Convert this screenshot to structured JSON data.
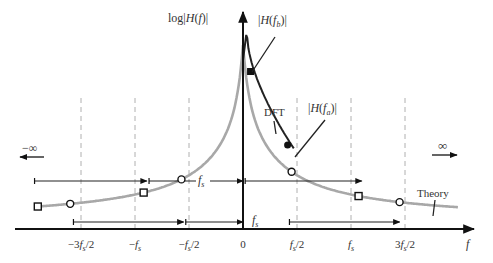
{
  "figure": {
    "y_axis_label": "log|H(f)|",
    "x_axis_label": "f",
    "tick_labels": [
      "-3f_s/2",
      "-f_s",
      "-f_s/2",
      "0",
      "f_s/2",
      "f_s",
      "3f_s/2"
    ],
    "tick_values": [
      -1.5,
      -1,
      -0.5,
      0,
      0.5,
      1,
      1.5
    ],
    "annotations": {
      "H_fb": "|H(f_b)|",
      "H_fa": "|H(f_a)|",
      "dft": "DFT",
      "theory": "Theory",
      "neg_inf": "−∞",
      "pos_inf": "∞",
      "fs_upper": "f_s",
      "fs_lower": "f_s"
    },
    "colors": {
      "theory_curve": "#a8a8a8",
      "dft_curve": "#222222",
      "axis": "#111111",
      "guide": "#b0b0b0",
      "text": "#333333"
    }
  },
  "chart_data": {
    "type": "line",
    "title": "",
    "xlabel": "f",
    "ylabel": "log|H(f)|",
    "x_unit": "f_s",
    "xlim": [
      -2.1,
      2.1
    ],
    "series": [
      {
        "name": "Theory",
        "description": "symmetric decaying log magnitude, peak at f=0"
      },
      {
        "name": "DFT",
        "description": "periodic aliased response, peak near f=0, higher than theory near f_s/2"
      }
    ],
    "markers": {
      "circles_x": [
        -1.6,
        -0.57,
        0.45,
        1.45
      ],
      "squares_x": [
        -1.9,
        -0.92,
        1.07
      ],
      "filled_circle_x": 0.45,
      "filled_square_x": 0.07
    },
    "vertical_guides": [
      -1.5,
      -1,
      -0.5,
      0.5,
      1,
      1.5
    ],
    "span_markers": [
      {
        "label": "f_s",
        "from": -1.9,
        "to": -0.92
      },
      {
        "label": "f_s",
        "from": -0.92,
        "to": 0.07
      },
      {
        "label": "f_s",
        "from": 0.07,
        "to": 1.07
      },
      {
        "label": "f_s",
        "from": -1.6,
        "to": -0.57
      },
      {
        "label": "f_s",
        "from": -0.57,
        "to": 0.45
      },
      {
        "label": "f_s",
        "from": 0.45,
        "to": 1.45
      }
    ]
  }
}
